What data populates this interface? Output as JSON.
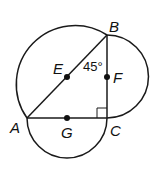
{
  "diagram": {
    "points": {
      "A": {
        "label": "A",
        "x": 27,
        "y": 118
      },
      "B": {
        "label": "B",
        "x": 107,
        "y": 35
      },
      "C": {
        "label": "C",
        "x": 107,
        "y": 118
      },
      "E": {
        "label": "E",
        "x": 67,
        "y": 77
      },
      "F": {
        "label": "F",
        "x": 107,
        "y": 77
      },
      "G": {
        "label": "G",
        "x": 67,
        "y": 118
      }
    },
    "angle_label": "45°",
    "right_angle_at": "C",
    "segments": [
      "AB",
      "BC",
      "AC"
    ],
    "arcs": [
      {
        "name": "semicircle-on-AB",
        "center": "E",
        "side": "upper-left"
      },
      {
        "name": "semicircle-on-BC",
        "center": "F",
        "side": "right"
      },
      {
        "name": "semicircle-on-AC",
        "center": "G",
        "side": "below"
      }
    ],
    "colors": {
      "stroke": "#1a1a1a",
      "background": "#ffffff"
    }
  }
}
